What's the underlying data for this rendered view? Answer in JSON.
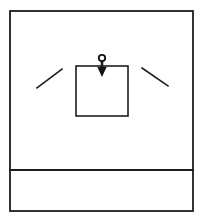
{
  "figure": {
    "kind": "line-art-diagram",
    "title": "",
    "caption": "",
    "background_color": "#ffffff",
    "ink_color": "#1d1d1d",
    "fill_color": "#111111",
    "canvas": {
      "width": 203,
      "height": 221
    }
  },
  "outer_frame": {
    "label": "",
    "x": 10,
    "y": 11,
    "width": 183,
    "height": 200,
    "stroke_width": 1.8
  },
  "bottom_band": {
    "label": "",
    "divider_y": 170,
    "x": 10,
    "width": 183,
    "height": 41,
    "stroke_width": 1.8
  },
  "inner_square": {
    "label": "",
    "x": 76,
    "y": 66,
    "width": 52,
    "height": 50,
    "stroke_width": 1.6
  },
  "arrow": {
    "label": "",
    "direction": "down",
    "head_ring": {
      "cx": 102,
      "cy": 58,
      "r": 3.2,
      "stroke_width": 1.8
    },
    "shaft": {
      "x": 102,
      "y_top": 61,
      "y_bottom": 70,
      "width": 2.6
    },
    "head_triangle": {
      "cx": 102,
      "y_top": 67,
      "y_tip": 77,
      "half_width": 4.6
    }
  },
  "tick_left": {
    "label": "",
    "x1": 37,
    "y1": 88,
    "x2": 62,
    "y2": 69,
    "stroke_width": 1.6
  },
  "tick_right": {
    "label": "",
    "x1": 142,
    "y1": 68,
    "x2": 168,
    "y2": 86,
    "stroke_width": 1.6
  }
}
